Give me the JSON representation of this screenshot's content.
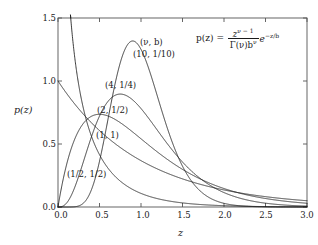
{
  "chart_data": {
    "type": "line",
    "title": "",
    "xlabel": "z",
    "ylabel": "p(z)",
    "xlim": [
      0,
      3
    ],
    "ylim": [
      0,
      1.5
    ],
    "xticks": [
      "0.0",
      "0.5",
      "1.0",
      "1.5",
      "2.0",
      "2.5",
      "3.0"
    ],
    "xtick_values": [
      0,
      0.5,
      1,
      1.5,
      2,
      2.5,
      3
    ],
    "yticks": [
      "0.0",
      "0.5",
      "1.0",
      "1.5"
    ],
    "ytick_values": [
      0,
      0.5,
      1,
      1.5
    ],
    "grid": false,
    "legend_position": "inline-annotations",
    "formula": {
      "lhs": "p(z) =",
      "numerator": "z",
      "numerator_exponent": "ν − 1",
      "denominator": "Γ(ν)b",
      "denominator_exponent": "ν",
      "tail": "e",
      "tail_exponent": "−z/b",
      "plain": "p(z) = z^(ν−1) / (Γ(ν) b^ν) · e^(−z/b)"
    },
    "parameter_header": "(ν, b)",
    "series": [
      {
        "name": "(10, 1/10)",
        "nu": 10,
        "b": 0.1,
        "label": "(10, 1/10)",
        "peak_z": 0.9,
        "peak_p": 1.318
      },
      {
        "name": "(4, 1/4)",
        "nu": 4,
        "b": 0.25,
        "label": "(4, 1/4)",
        "peak_z": 0.75,
        "peak_p": 0.89
      },
      {
        "name": "(2, 1/2)",
        "nu": 2,
        "b": 0.5,
        "label": "(2, 1/2)",
        "peak_z": 0.5,
        "peak_p": 0.736
      },
      {
        "name": "(1, 1)",
        "nu": 1,
        "b": 1,
        "label": "(1, 1)",
        "peak_z": 0,
        "peak_p": 1.0
      },
      {
        "name": "(1/2, 1/2)",
        "nu": 0.5,
        "b": 0.5,
        "label": "(1/2, 1/2)",
        "peak_z": 0,
        "peak_p": null
      }
    ]
  },
  "axes": {
    "x_label": "z",
    "y_label": "p(z)"
  },
  "colors": {
    "curve": "#1a1a1a",
    "axis": "#555555",
    "background": "#ffffff"
  }
}
